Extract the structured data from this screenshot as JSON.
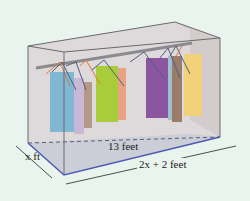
{
  "diagram": {
    "labels": {
      "depth": "x ft",
      "diagonal": "13 feet",
      "length": "2x + 2 feet"
    },
    "colors": {
      "background": "#eaf4ef",
      "box_fill": "#d9d2d4",
      "floor_edge": "#4a5bb5",
      "rod": "#8a8a8f"
    },
    "clothes": [
      {
        "color": "#7fb7d4"
      },
      {
        "color": "#c9b7d6"
      },
      {
        "color": "#b49a86"
      },
      {
        "color": "#a9cc3a"
      },
      {
        "color": "#e8a383"
      },
      {
        "color": "#f0c77a"
      },
      {
        "color": "#8b55a0"
      },
      {
        "color": "#9cc0d0"
      },
      {
        "color": "#9a7c6a"
      },
      {
        "color": "#f1d278"
      }
    ]
  }
}
